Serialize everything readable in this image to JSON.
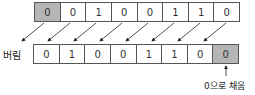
{
  "diagram": {
    "type": "logical-shift-left",
    "top_row": {
      "bits": [
        "0",
        "0",
        "1",
        "0",
        "0",
        "1",
        "1",
        "0"
      ],
      "shaded_index": 0
    },
    "bottom_row": {
      "bits": [
        "0",
        "1",
        "0",
        "0",
        "1",
        "1",
        "0",
        "0"
      ],
      "shaded_index": 7
    },
    "labels": {
      "discard": "버림",
      "fill": "0으로 채움"
    },
    "colors": {
      "shaded": "#b5b5b5",
      "border": "#555555",
      "arrow": "#222222"
    }
  }
}
